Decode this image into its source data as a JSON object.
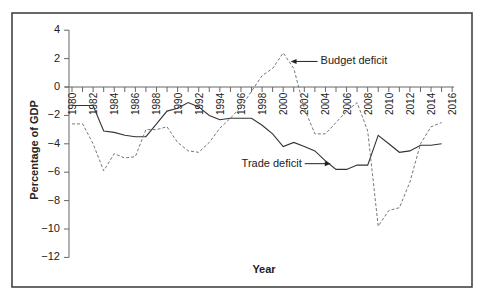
{
  "chart_data": {
    "type": "line",
    "title": "",
    "xlabel": "Year",
    "ylabel": "Percentage of GDP",
    "xlim": [
      1980,
      2016
    ],
    "ylim": [
      -12,
      4
    ],
    "grid": false,
    "legend": "none (inline annotations)",
    "x_ticks": [
      "1980",
      "1982",
      "1984",
      "1986",
      "1988",
      "1990",
      "1992",
      "1994",
      "1996",
      "1998",
      "2000",
      "2002",
      "2004",
      "2006",
      "2008",
      "2010",
      "2012",
      "2014",
      "2016"
    ],
    "y_ticks": [
      "4",
      "2",
      "0",
      "−2",
      "−4",
      "−6",
      "−8",
      "−10",
      "−12"
    ],
    "y_tick_values": [
      4,
      2,
      0,
      -2,
      -4,
      -6,
      -8,
      -10,
      -12
    ],
    "x_tick_values": [
      1980,
      1982,
      1984,
      1986,
      1988,
      1990,
      1992,
      1994,
      1996,
      1998,
      2000,
      2002,
      2004,
      2006,
      2008,
      2010,
      2012,
      2014,
      2016
    ],
    "x": [
      1980,
      1981,
      1982,
      1983,
      1984,
      1985,
      1986,
      1987,
      1988,
      1989,
      1990,
      1991,
      1992,
      1993,
      1994,
      1995,
      1996,
      1997,
      1998,
      1999,
      2000,
      2001,
      2002,
      2003,
      2004,
      2005,
      2006,
      2007,
      2008,
      2009,
      2010,
      2011,
      2012,
      2013,
      2014,
      2015
    ],
    "series": [
      {
        "name": "Trade deficit",
        "style": "solid",
        "values": [
          -1.3,
          -1.3,
          -1.3,
          -3.1,
          -3.2,
          -3.4,
          -3.5,
          -3.5,
          -2.6,
          -1.7,
          -1.5,
          -1.1,
          -1.4,
          -2.0,
          -2.3,
          -2.2,
          -2.2,
          -2.2,
          -2.7,
          -3.3,
          -4.2,
          -3.9,
          -4.2,
          -4.5,
          -5.2,
          -5.8,
          -5.8,
          -5.5,
          -5.5,
          -3.4,
          -4.0,
          -4.6,
          -4.5,
          -4.1,
          -4.1,
          -4.0
        ]
      },
      {
        "name": "Budget deficit",
        "style": "dashed",
        "values": [
          -2.6,
          -2.6,
          -4.0,
          -5.9,
          -4.7,
          -5.0,
          -4.9,
          -3.0,
          -3.0,
          -2.8,
          -3.9,
          -4.5,
          -4.6,
          -3.9,
          -2.9,
          -2.2,
          -1.4,
          -0.3,
          0.8,
          1.3,
          2.4,
          1.3,
          -1.5,
          -3.3,
          -3.3,
          -2.5,
          -1.7,
          -1.1,
          -3.1,
          -9.8,
          -8.7,
          -8.5,
          -6.7,
          -4.0,
          -2.8,
          -2.5
        ]
      }
    ],
    "annotations": [
      {
        "text": "Budget deficit",
        "points_to": {
          "series": "Budget deficit",
          "x": 2000.7,
          "y": 1.8
        }
      },
      {
        "text": "Trade deficit",
        "points_to": {
          "series": "Trade deficit",
          "x": 2004.5,
          "y": -5.4
        }
      }
    ]
  }
}
